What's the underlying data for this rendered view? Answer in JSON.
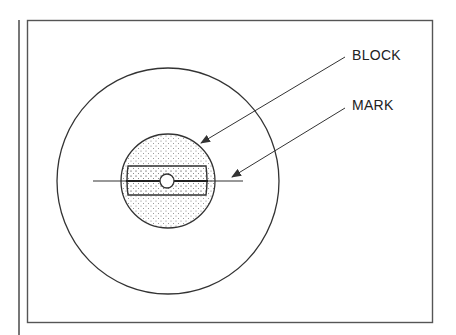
{
  "diagram": {
    "labels": {
      "block": "BLOCK",
      "mark": "MARK"
    },
    "colors": {
      "stroke": "#333333",
      "frame": "#555555",
      "stipple": "#777777",
      "background": "#ffffff"
    }
  }
}
